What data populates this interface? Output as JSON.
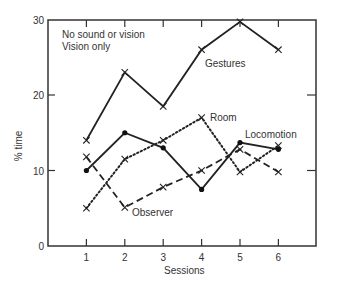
{
  "chart_data": {
    "type": "line",
    "title": "",
    "xlabel": "Sessions",
    "ylabel": "% time",
    "x": [
      1,
      2,
      3,
      4,
      5,
      6
    ],
    "xlim": [
      0,
      7
    ],
    "ylim": [
      0,
      30
    ],
    "yticks": [
      0,
      10,
      20,
      30
    ],
    "xticks": [
      1,
      2,
      3,
      4,
      5,
      6
    ],
    "grid": false,
    "legend": {
      "position": "top-left",
      "entries": [
        "No sound or vision",
        "Vision only"
      ]
    },
    "series": [
      {
        "name": "Gestures",
        "style": "solid",
        "marker": "x",
        "values": [
          14,
          23,
          18.5,
          26,
          29.7,
          26
        ]
      },
      {
        "name": "Room",
        "style": "dotted",
        "marker": "x",
        "values": [
          5,
          11.5,
          14,
          17,
          9.8,
          13.3
        ]
      },
      {
        "name": "Locomotion",
        "style": "solid",
        "marker": "dot",
        "values": [
          10,
          15,
          13,
          7.5,
          13.7,
          12.8
        ]
      },
      {
        "name": "Observer",
        "style": "dashed",
        "marker": "x",
        "values": [
          11.8,
          5.1,
          7.8,
          10,
          12.8,
          9.8
        ]
      }
    ],
    "annotations": [
      {
        "text": "Gestures",
        "near_session": 4
      },
      {
        "text": "Room",
        "near_session": 4
      },
      {
        "text": "Locomotion",
        "near_session": 5
      },
      {
        "text": "Observer",
        "near_session": 2
      }
    ]
  },
  "labels": {
    "legend_line1": "No sound or vision",
    "legend_line2": "Vision only",
    "xlabel": "Sessions",
    "ylabel": "% time",
    "gestures": "Gestures",
    "room": "Room",
    "locomotion": "Locomotion",
    "observer": "Observer"
  }
}
